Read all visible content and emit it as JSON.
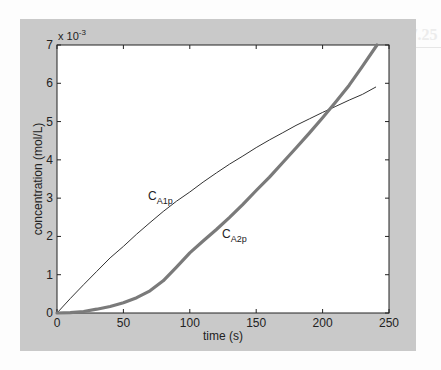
{
  "page": {
    "background_heading": "Example 7.25"
  },
  "chart_data": {
    "type": "line",
    "title": "",
    "xlabel": "time (s)",
    "ylabel": "concentration (mol/L)",
    "y_exponent_label": "x 10",
    "y_exponent_power": "-3",
    "xlim": [
      0,
      250
    ],
    "ylim": [
      0,
      7
    ],
    "y_scale_factor": 0.001,
    "x_ticks": [
      0,
      50,
      100,
      150,
      200,
      250
    ],
    "y_ticks": [
      0,
      1,
      2,
      3,
      4,
      5,
      6,
      7
    ],
    "grid": false,
    "legend": "none (inline curve labels)",
    "series": [
      {
        "name": "C_A1p",
        "label_main": "C",
        "label_sub": "A1p",
        "style": "thin",
        "color": "#333333",
        "x": [
          0,
          10,
          20,
          30,
          40,
          50,
          60,
          70,
          80,
          90,
          100,
          110,
          120,
          130,
          140,
          150,
          160,
          170,
          180,
          190,
          200,
          210,
          220,
          230,
          240
        ],
        "y": [
          0,
          0.38,
          0.74,
          1.09,
          1.44,
          1.74,
          2.06,
          2.36,
          2.65,
          2.92,
          3.16,
          3.42,
          3.66,
          3.89,
          4.1,
          4.32,
          4.52,
          4.71,
          4.9,
          5.07,
          5.24,
          5.4,
          5.56,
          5.71,
          5.9
        ]
      },
      {
        "name": "C_A2p",
        "label_main": "C",
        "label_sub": "A2p",
        "style": "thick",
        "color": "#7a7a7a",
        "x": [
          0,
          10,
          20,
          30,
          40,
          50,
          60,
          70,
          80,
          90,
          100,
          110,
          120,
          130,
          140,
          150,
          160,
          170,
          180,
          190,
          200,
          210,
          220,
          230,
          241
        ],
        "y": [
          0,
          0.01,
          0.04,
          0.1,
          0.17,
          0.27,
          0.4,
          0.58,
          0.84,
          1.2,
          1.57,
          1.88,
          2.18,
          2.5,
          2.84,
          3.2,
          3.55,
          3.93,
          4.31,
          4.7,
          5.1,
          5.52,
          5.95,
          6.44,
          7.0
        ]
      }
    ]
  }
}
